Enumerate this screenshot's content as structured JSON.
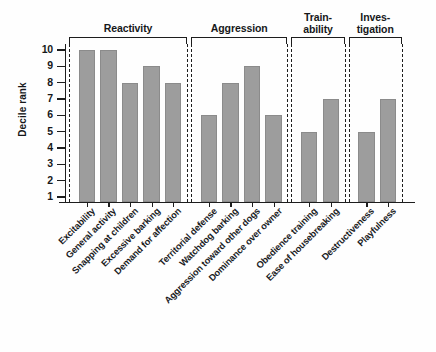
{
  "chart_data": {
    "type": "bar",
    "title": "",
    "subtitle": "",
    "xlabel": "",
    "ylabel": "Decile rank",
    "ylim": [
      0,
      10
    ],
    "yticks": [
      10,
      9,
      8,
      7,
      6,
      5,
      4,
      3,
      2,
      1
    ],
    "grid": false,
    "legend": null,
    "bar_color": "#9d9d9d",
    "axis_color": "#1d1d1d",
    "categories": [
      "Excitability",
      "General activity",
      "Snapping at children",
      "Excessive barking",
      "Demand for affection",
      "Territorial defense",
      "Watchdog barking",
      "Aggression toward other dogs",
      "Dominance over owner",
      "Obedience training",
      "Ease of housebreaking",
      "Destructiveness",
      "Playfulness"
    ],
    "values": [
      10,
      10,
      8,
      9,
      8,
      6,
      8,
      9,
      6,
      5,
      7,
      5,
      7
    ],
    "groups": [
      {
        "label": "Reactivity",
        "label_lines": [
          "Reactivity"
        ],
        "start": 0,
        "end": 4
      },
      {
        "label": "Aggression",
        "label_lines": [
          "Aggression"
        ],
        "start": 5,
        "end": 8
      },
      {
        "label": "Trainability",
        "label_lines": [
          "Train-",
          "ability"
        ],
        "start": 9,
        "end": 10
      },
      {
        "label": "Investigation",
        "label_lines": [
          "Inves-",
          "tigation"
        ],
        "start": 11,
        "end": 12
      }
    ]
  }
}
